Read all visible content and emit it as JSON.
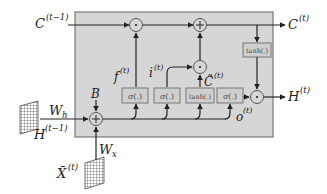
{
  "diagram": {
    "type": "LSTM cell",
    "colors": {
      "cell_fill": "#d6d6d6",
      "cell_border": "#777777",
      "gate_fill": "#cfcfcf",
      "gate_border": "#777777",
      "line": "#222222"
    },
    "labels": {
      "c_prev": "C",
      "c_prev_sup": "(t−1)",
      "c_out": "C",
      "c_out_sup": "(t)",
      "h_out": "H",
      "h_out_sup": "(t)",
      "h_prev": "H",
      "h_prev_sup": "(t−1)",
      "w_h": "W",
      "w_h_sub": "h",
      "w_x": "W",
      "w_x_sub": "x",
      "x_in": "X̄",
      "x_in_sup": "(t)",
      "bias": "B",
      "forget": "f",
      "forget_sup": "(t)",
      "input": "i",
      "input_sup": "(t)",
      "candidate": "C̃",
      "candidate_sup": "(t)",
      "output": "o",
      "output_sup": "(t)"
    },
    "gates": [
      {
        "name": "forget-gate",
        "label": "σ(.)"
      },
      {
        "name": "input-gate",
        "label": "σ(.)"
      },
      {
        "name": "candidate-gate",
        "label": "tanh(.)"
      },
      {
        "name": "output-gate",
        "label": "σ(.)"
      }
    ],
    "cell_tanh": {
      "label": "tanh(.)"
    },
    "operators": {
      "mul": "·",
      "add": "+"
    }
  }
}
